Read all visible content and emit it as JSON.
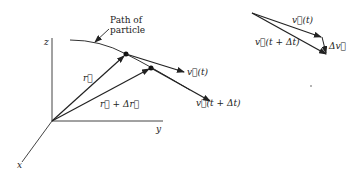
{
  "figure": {
    "axes": {
      "x_label": "x",
      "y_label": "y",
      "z_label": "z"
    },
    "path_label_line1": "Path of",
    "path_label_line2": "particle",
    "vector_labels": {
      "r": "r⃗",
      "r_plus_dr": "r⃗ + Δr⃗",
      "v_t": "v⃗(t)",
      "v_t_dt": "v⃗(t + Δt)"
    },
    "triangle_labels": {
      "v_t": "v⃗(t)",
      "v_t_dt": "v⃗(t + Δt)",
      "delta_v": "Δv⃗"
    },
    "colors": {
      "ink": "#222222",
      "background": "#ffffff"
    }
  }
}
